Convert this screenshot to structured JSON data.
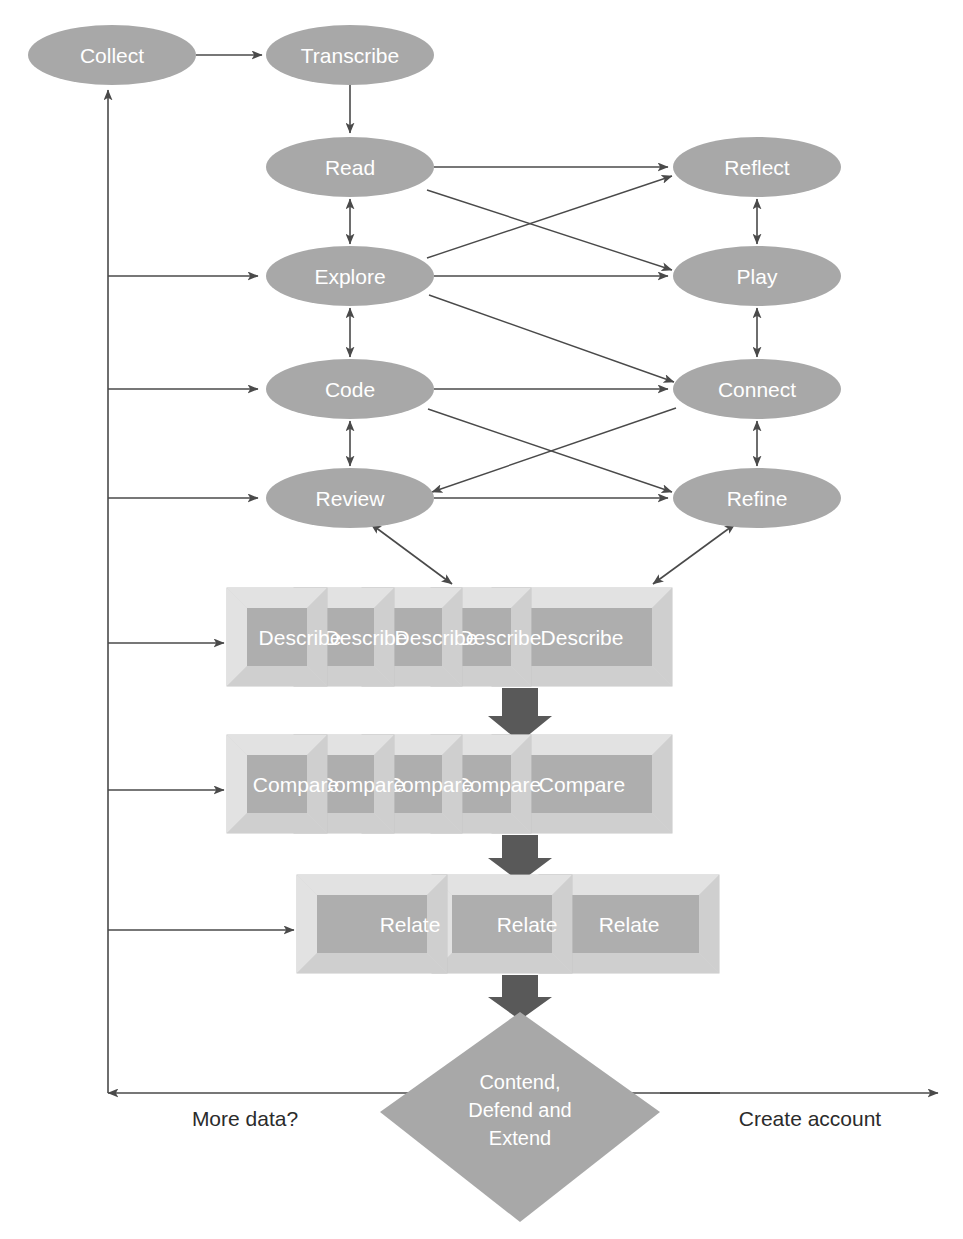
{
  "diagram": {
    "colors": {
      "node_fill": "#a8a8a8",
      "node_text": "#ffffff",
      "box_face": "#aeaeae",
      "box_bevel": "#d6d6d6",
      "connector": "#4a4a4a",
      "fat_arrow": "#595959",
      "background": "#ffffff"
    },
    "nodes": [
      {
        "id": "collect",
        "label": "Collect",
        "shape": "ellipse",
        "cx": 112,
        "cy": 55,
        "rx": 84,
        "ry": 30
      },
      {
        "id": "transcribe",
        "label": "Transcribe",
        "shape": "ellipse",
        "cx": 350,
        "cy": 55,
        "rx": 84,
        "ry": 30
      },
      {
        "id": "read",
        "label": "Read",
        "shape": "ellipse",
        "cx": 350,
        "cy": 167,
        "rx": 84,
        "ry": 30
      },
      {
        "id": "explore",
        "label": "Explore",
        "shape": "ellipse",
        "cx": 350,
        "cy": 276,
        "rx": 84,
        "ry": 30
      },
      {
        "id": "code",
        "label": "Code",
        "shape": "ellipse",
        "cx": 350,
        "cy": 389,
        "rx": 84,
        "ry": 30
      },
      {
        "id": "review",
        "label": "Review",
        "shape": "ellipse",
        "cx": 350,
        "cy": 498,
        "rx": 84,
        "ry": 30
      },
      {
        "id": "reflect",
        "label": "Reflect",
        "shape": "ellipse",
        "cx": 757,
        "cy": 167,
        "rx": 84,
        "ry": 30
      },
      {
        "id": "play",
        "label": "Play",
        "shape": "ellipse",
        "cx": 757,
        "cy": 276,
        "rx": 84,
        "ry": 30
      },
      {
        "id": "connect",
        "label": "Connect",
        "shape": "ellipse",
        "cx": 757,
        "cy": 389,
        "rx": 84,
        "ry": 30
      },
      {
        "id": "refine",
        "label": "Refine",
        "shape": "ellipse",
        "cx": 757,
        "cy": 498,
        "rx": 84,
        "ry": 30
      }
    ],
    "stacks": [
      {
        "id": "describe",
        "label": "Describe",
        "count": 5,
        "x": 227,
        "y": 588,
        "width": 445,
        "height": 98
      },
      {
        "id": "compare",
        "label": "Compare",
        "count": 5,
        "x": 227,
        "y": 735,
        "width": 445,
        "height": 98
      },
      {
        "id": "relate",
        "label": "Relate",
        "count": 3,
        "x": 297,
        "y": 875,
        "width": 422,
        "height": 98
      }
    ],
    "decision": {
      "id": "contend",
      "lines": [
        "Contend,",
        "Defend and",
        "Extend"
      ],
      "cx": 520,
      "cy": 1112,
      "rx": 140,
      "ry": 105
    },
    "edge_labels": [
      {
        "id": "more-data",
        "text": "More data?",
        "x": 245,
        "y": 1118
      },
      {
        "id": "create-account",
        "text": "Create account",
        "x": 810,
        "y": 1118
      }
    ],
    "connections": [
      {
        "from": "collect",
        "to": "transcribe",
        "kind": "arrow"
      },
      {
        "from": "transcribe",
        "to": "read",
        "kind": "arrow"
      },
      {
        "from": "read",
        "to": "explore",
        "kind": "double"
      },
      {
        "from": "explore",
        "to": "code",
        "kind": "double"
      },
      {
        "from": "code",
        "to": "review",
        "kind": "double"
      },
      {
        "from": "reflect",
        "to": "play",
        "kind": "double"
      },
      {
        "from": "play",
        "to": "connect",
        "kind": "double"
      },
      {
        "from": "connect",
        "to": "refine",
        "kind": "double"
      },
      {
        "from": "read",
        "to": "reflect",
        "kind": "arrow"
      },
      {
        "from": "read",
        "to": "play",
        "kind": "arrow"
      },
      {
        "from": "explore",
        "to": "reflect",
        "kind": "arrow"
      },
      {
        "from": "explore",
        "to": "play",
        "kind": "arrow"
      },
      {
        "from": "explore",
        "to": "connect",
        "kind": "arrow"
      },
      {
        "from": "code",
        "to": "connect",
        "kind": "arrow"
      },
      {
        "from": "code",
        "to": "refine",
        "kind": "arrow"
      },
      {
        "from": "review",
        "to": "refine",
        "kind": "arrow"
      },
      {
        "from": "connect",
        "to": "review",
        "kind": "arrow"
      },
      {
        "from": "review",
        "to": "describe",
        "kind": "double"
      },
      {
        "from": "refine",
        "to": "describe",
        "kind": "double"
      },
      {
        "from": "describe",
        "to": "compare",
        "kind": "fat-arrow"
      },
      {
        "from": "compare",
        "to": "relate",
        "kind": "fat-arrow"
      },
      {
        "from": "relate",
        "to": "contend",
        "kind": "fat-arrow"
      },
      {
        "from": "contend",
        "to": "more-data",
        "kind": "arrow"
      },
      {
        "from": "contend",
        "to": "create-account",
        "kind": "arrow"
      },
      {
        "from": "feedback-spine",
        "to": "collect",
        "kind": "arrow"
      },
      {
        "from": "feedback-spine",
        "to": "explore",
        "kind": "arrow"
      },
      {
        "from": "feedback-spine",
        "to": "code",
        "kind": "arrow"
      },
      {
        "from": "feedback-spine",
        "to": "review",
        "kind": "arrow"
      },
      {
        "from": "feedback-spine",
        "to": "describe",
        "kind": "arrow"
      },
      {
        "from": "feedback-spine",
        "to": "compare",
        "kind": "arrow"
      },
      {
        "from": "feedback-spine",
        "to": "relate",
        "kind": "arrow"
      }
    ]
  }
}
